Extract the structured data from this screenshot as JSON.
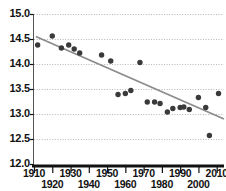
{
  "chart": {
    "title": "",
    "type": "scatter"
  },
  "chart_data": {
    "type": "scatter",
    "title": "",
    "subtitle": "",
    "xlabel": "",
    "ylabel": "",
    "xlim": [
      1910,
      2014
    ],
    "ylim": [
      12.0,
      15.0
    ],
    "grid": true,
    "grid_axis": "y",
    "legend": false,
    "marker_color": "#3a3a3a",
    "trendline_color": "#8c8c8c",
    "y_ticks": [
      "15.0",
      "14.5",
      "14.0",
      "13.5",
      "13.0",
      "12.5",
      "12.0"
    ],
    "y_tick_values": [
      15.0,
      14.5,
      14.0,
      13.5,
      13.0,
      12.5,
      12.0
    ],
    "x_ticks_upper": [
      "1910",
      "1930",
      "1950",
      "1970",
      "1990",
      "2010"
    ],
    "x_ticks_lower": [
      "1920",
      "1940",
      "1960",
      "1980",
      "2000"
    ],
    "x_tick_values_upper": [
      1910,
      1930,
      1950,
      1970,
      1990,
      2010
    ],
    "x_tick_values_lower": [
      1920,
      1940,
      1960,
      1980,
      2000
    ],
    "points": [
      {
        "x": 1912,
        "y": 14.38
      },
      {
        "x": 1920,
        "y": 14.56
      },
      {
        "x": 1925,
        "y": 14.32
      },
      {
        "x": 1929,
        "y": 14.38
      },
      {
        "x": 1932,
        "y": 14.3
      },
      {
        "x": 1935,
        "y": 14.22
      },
      {
        "x": 1947,
        "y": 14.18
      },
      {
        "x": 1952,
        "y": 14.06
      },
      {
        "x": 1956,
        "y": 13.39
      },
      {
        "x": 1960,
        "y": 13.41
      },
      {
        "x": 1963,
        "y": 13.47
      },
      {
        "x": 1968,
        "y": 14.03
      },
      {
        "x": 1972,
        "y": 13.24
      },
      {
        "x": 1976,
        "y": 13.24
      },
      {
        "x": 1979,
        "y": 13.21
      },
      {
        "x": 1983,
        "y": 13.04
      },
      {
        "x": 1986,
        "y": 13.11
      },
      {
        "x": 1990,
        "y": 13.13
      },
      {
        "x": 1992,
        "y": 13.14
      },
      {
        "x": 1995,
        "y": 13.09
      },
      {
        "x": 2000,
        "y": 13.33
      },
      {
        "x": 2004,
        "y": 13.13
      },
      {
        "x": 2006,
        "y": 12.57
      },
      {
        "x": 2011,
        "y": 13.41
      }
    ],
    "trendline": {
      "x_start": 1911,
      "y_start": 14.55,
      "x_end": 2014,
      "y_end": 12.9
    }
  }
}
